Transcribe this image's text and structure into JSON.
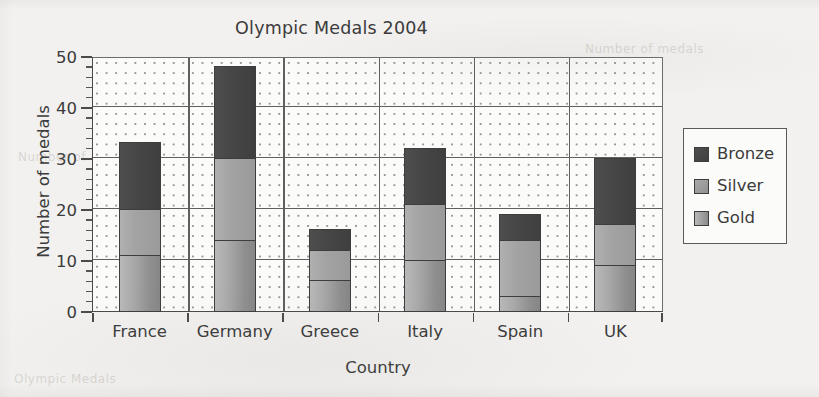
{
  "chart_data": {
    "type": "bar",
    "subtype": "stacked-bar",
    "title": "Olympic Medals 2004",
    "xlabel": "Country",
    "ylabel": "Number of medals",
    "categories": [
      "France",
      "Germany",
      "Greece",
      "Italy",
      "Spain",
      "UK"
    ],
    "series": [
      {
        "name": "Gold",
        "values": [
          11,
          14,
          6,
          10,
          3,
          9
        ]
      },
      {
        "name": "Silver",
        "values": [
          9,
          16,
          6,
          11,
          11,
          8
        ]
      },
      {
        "name": "Bronze",
        "values": [
          13,
          18,
          4,
          11,
          5,
          13
        ]
      }
    ],
    "totals": [
      33,
      48,
      16,
      32,
      19,
      30
    ],
    "stack_order_bottom_to_top": [
      "Gold",
      "Silver",
      "Bronze"
    ],
    "ylim": [
      0,
      50
    ],
    "y_major_ticks": [
      0,
      10,
      20,
      30,
      40,
      50
    ],
    "y_minor_tick_step": 2,
    "y_tick_labels": [
      "0",
      "10",
      "20",
      "30",
      "40",
      "50"
    ],
    "grid": "dotted-minor-solid-major",
    "legend_position": "right-outside",
    "legend_entries": [
      "Bronze",
      "Silver",
      "Gold"
    ],
    "colors": {
      "bronze": "#464646",
      "silver": "#a3a3a3",
      "gold": "#a0a0a0",
      "axis": "#4a4a4a",
      "grid": "#5f5f5f",
      "text": "#3b3b3b",
      "background": "#f2f1ef",
      "plot_background": "#fbfbfa"
    }
  },
  "legend": {
    "items": [
      {
        "label": "Bronze",
        "swatch": "bronze"
      },
      {
        "label": "Silver",
        "swatch": "silver"
      },
      {
        "label": "Gold",
        "swatch": "gold"
      }
    ]
  },
  "background_text": {
    "top_right": "Number of medals",
    "mid_left": "Number of medals",
    "bottom_left": "Olympic Medals"
  }
}
